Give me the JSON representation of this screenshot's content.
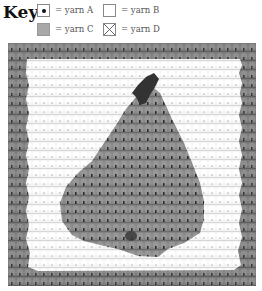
{
  "key": {
    "title": "Key",
    "items": [
      {
        "symbol": "dot-in-square",
        "label": "= yarn A",
        "color": "#2a2a2a"
      },
      {
        "symbol": "empty-square",
        "label": "= yarn B",
        "color": "#ffffff"
      },
      {
        "symbol": "grey-square",
        "label": "= yarn C",
        "color": "#a8a8a8"
      },
      {
        "symbol": "x-in-square",
        "label": "= yarn D",
        "color": "#ffffff"
      }
    ]
  },
  "swatch": {
    "subject": "pear",
    "colors": {
      "border": "#7a7a7a",
      "background": "#f2f2f2",
      "pear": "#8c8c8c",
      "stem": "#3a3a3a"
    }
  }
}
